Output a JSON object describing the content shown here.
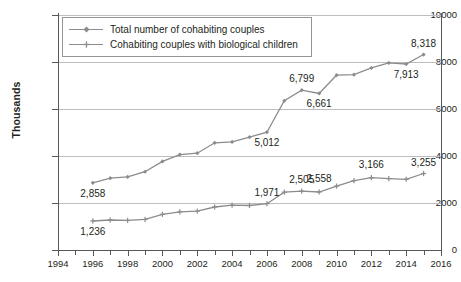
{
  "chart_data": {
    "type": "line",
    "title": "",
    "xlabel": "",
    "ylabel": "Thousands",
    "xlim": [
      1994,
      2016
    ],
    "ylim": [
      0,
      10000
    ],
    "ytick_values": [
      0,
      2000,
      4000,
      6000,
      8000,
      10000
    ],
    "ytick_labels": [
      "0",
      "2000",
      "4000",
      "6000",
      "8000",
      "10000"
    ],
    "xtick_values": [
      1994,
      1996,
      1998,
      2000,
      2002,
      2004,
      2006,
      2008,
      2010,
      2012,
      2014,
      2016
    ],
    "xtick_labels": [
      "1994",
      "1996",
      "1998",
      "2000",
      "2002",
      "2004",
      "2006",
      "2008",
      "2010",
      "2012",
      "2014",
      "2016"
    ],
    "x_minor_step": 1,
    "grid": "horizontal",
    "legend_position": "top-left",
    "x": [
      1996,
      1997,
      1998,
      1999,
      2000,
      2001,
      2002,
      2003,
      2004,
      2005,
      2006,
      2007,
      2008,
      2009,
      2010,
      2011,
      2012,
      2013,
      2014,
      2015
    ],
    "series": [
      {
        "name": "Total number of cohabiting couples",
        "color": "#8c8c8e",
        "marker": "diamond",
        "values": [
          2858,
          3058,
          3110,
          3330,
          3770,
          4060,
          4120,
          4560,
          4600,
          4800,
          5012,
          6350,
          6799,
          6661,
          7440,
          7460,
          7750,
          7960,
          7913,
          8318
        ],
        "labels": [
          {
            "x": 1996,
            "value": 2858,
            "text": "2,858",
            "position": "below"
          },
          {
            "x": 2006,
            "value": 5012,
            "text": "5,012",
            "position": "below"
          },
          {
            "x": 2008,
            "value": 6799,
            "text": "6,799",
            "position": "above"
          },
          {
            "x": 2009,
            "value": 6661,
            "text": "6,661",
            "position": "below"
          },
          {
            "x": 2014,
            "value": 7913,
            "text": "7,913",
            "position": "below"
          },
          {
            "x": 2015,
            "value": 8318,
            "text": "8,318",
            "position": "above"
          }
        ]
      },
      {
        "name": "Cohabiting couples with biological children",
        "color": "#8c8c8e",
        "marker": "plus",
        "values": [
          1236,
          1275,
          1258,
          1300,
          1520,
          1625,
          1655,
          1830,
          1905,
          1895,
          1971,
          2460,
          2505,
          2470,
          2720,
          2950,
          3080,
          3040,
          3010,
          3255
        ],
        "labels": [
          {
            "x": 1996,
            "value": 1236,
            "text": "1,236",
            "position": "below"
          },
          {
            "x": 2006,
            "value": 1971,
            "text": "1,971",
            "position": "above"
          },
          {
            "x": 2008,
            "value": 2505,
            "text": "2,505",
            "position": "above"
          },
          {
            "x": 2009,
            "value": 2558,
            "text": "2,558",
            "position": "above"
          },
          {
            "x": 2012,
            "value": 3166,
            "text": "3,166",
            "position": "above"
          },
          {
            "x": 2015,
            "value": 3255,
            "text": "3,255",
            "position": "above"
          }
        ]
      }
    ]
  }
}
